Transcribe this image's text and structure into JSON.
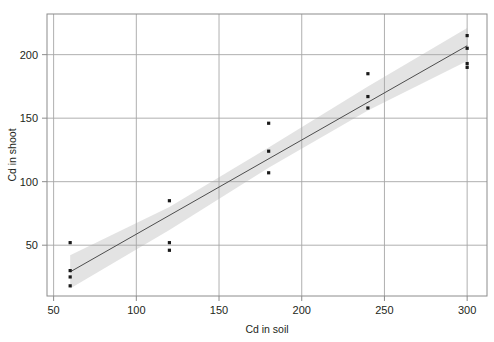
{
  "chart_data": {
    "type": "scatter",
    "title": "",
    "xlabel": "Cd in soil",
    "ylabel": "Cd in shoot",
    "xlim": [
      46,
      312
    ],
    "ylim": [
      10,
      232
    ],
    "xticks": [
      50,
      100,
      150,
      200,
      250,
      300
    ],
    "yticks": [
      50,
      100,
      150,
      200
    ],
    "grid": true,
    "legend": "none",
    "marker": "square",
    "marker_color": "#1a1a1a",
    "line_color": "#4d4d4d",
    "band_color": "#d9d9d9",
    "frame_color": "#8c8c8c",
    "grid_color": "#a6a6a6",
    "points": [
      {
        "x": 60,
        "y": 52
      },
      {
        "x": 60,
        "y": 30
      },
      {
        "x": 60,
        "y": 25
      },
      {
        "x": 60,
        "y": 18
      },
      {
        "x": 120,
        "y": 85
      },
      {
        "x": 120,
        "y": 52
      },
      {
        "x": 120,
        "y": 46
      },
      {
        "x": 180,
        "y": 146
      },
      {
        "x": 180,
        "y": 124
      },
      {
        "x": 180,
        "y": 107
      },
      {
        "x": 240,
        "y": 185
      },
      {
        "x": 240,
        "y": 167
      },
      {
        "x": 240,
        "y": 158
      },
      {
        "x": 300,
        "y": 215
      },
      {
        "x": 300,
        "y": 205
      },
      {
        "x": 300,
        "y": 193
      },
      {
        "x": 300,
        "y": 190
      }
    ],
    "fit_line": {
      "name": "linear regression",
      "x_start": 60,
      "x_end": 300,
      "y_start": 29,
      "y_end": 207,
      "slope": 0.742,
      "intercept": -15.5
    },
    "confidence_band": {
      "name": "confidence interval",
      "upper": [
        {
          "x": 60,
          "y": 42
        },
        {
          "x": 120,
          "y": 80
        },
        {
          "x": 180,
          "y": 127
        },
        {
          "x": 240,
          "y": 175
        },
        {
          "x": 300,
          "y": 221
        }
      ],
      "lower": [
        {
          "x": 60,
          "y": 16
        },
        {
          "x": 120,
          "y": 62
        },
        {
          "x": 180,
          "y": 111
        },
        {
          "x": 240,
          "y": 156
        },
        {
          "x": 300,
          "y": 195
        }
      ]
    }
  }
}
